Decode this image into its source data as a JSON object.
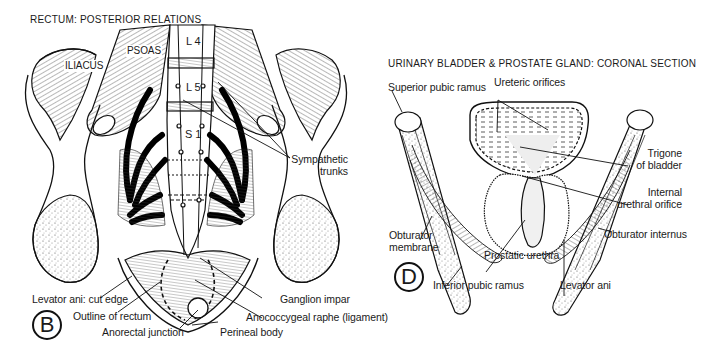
{
  "figure_b": {
    "title": "RECTUM: POSTERIOR RELATIONS",
    "badge": "B",
    "vertebrae": [
      "L 4",
      "L 5",
      "S 1"
    ],
    "muscle_labels": {
      "iliacus": "ILIACUS",
      "psoas": "PSOAS"
    },
    "labels": {
      "sympathetic_trunks_1": "Sympathetic",
      "sympathetic_trunks_2": "trunks",
      "ganglion_impar": "Ganglion impar",
      "anococcygeal_raphe": "Anococcygeal raphe (ligament)",
      "perineal_body": "Perineal body",
      "anorectal_junction": "Anorectal junction",
      "outline_of_rectum": "Outline of rectum",
      "levator_ani_cut_edge": "Levator ani: cut edge"
    }
  },
  "figure_d": {
    "title": "URINARY BLADDER & PROSTATE GLAND: CORONAL SECTION",
    "badge": "D",
    "labels": {
      "superior_pubic_ramus": "Superior pubic ramus",
      "ureteric_orifices": "Ureteric orifices",
      "trigone_1": "Trigone",
      "trigone_2": "of bladder",
      "internal_urethral_1": "Internal",
      "internal_urethral_2": "urethral orifice",
      "obturator_internus": "Obturator internus",
      "levator_ani": "Levator ani",
      "prostatic_urethra": "Prostatic urethra",
      "inferior_pubic_ramus": "Inferior pubic ramus",
      "obturator_membrane_1": "Obturator",
      "obturator_membrane_2": "membrane"
    }
  },
  "colors": {
    "ink": "#111111",
    "background": "#ffffff",
    "stipple": "#888888"
  }
}
